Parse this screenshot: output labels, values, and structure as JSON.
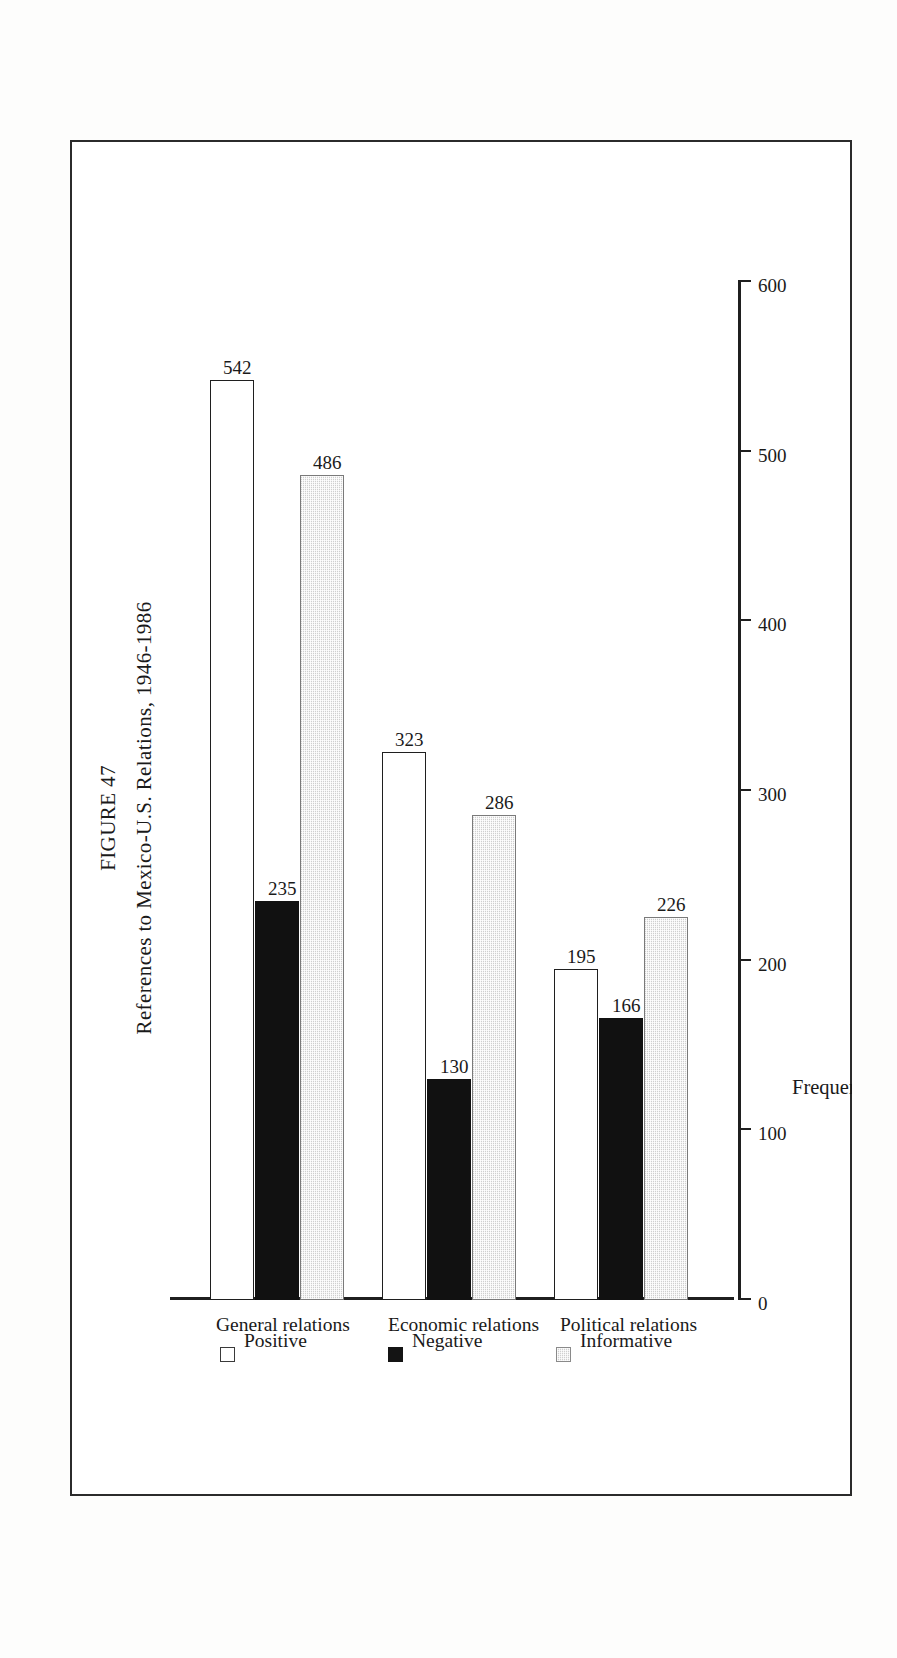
{
  "figure": {
    "number_label": "FIGURE 47",
    "caption": "References to Mexico-U.S. Relations, 1946-1986"
  },
  "legend": {
    "position": "below-plot",
    "entries": [
      {
        "label": "Positive",
        "swatch": "white-square-icon",
        "color": "#ffffff"
      },
      {
        "label": "Negative",
        "swatch": "black-square-icon",
        "color": "#111111"
      },
      {
        "label": "Informative",
        "swatch": "gray-hatched-square-icon",
        "color": "#cfcfcf"
      }
    ]
  },
  "axes": {
    "value_axis_title": "Frequency",
    "value_ticks": [
      "0",
      "100",
      "200",
      "300",
      "400",
      "500",
      "600"
    ],
    "category_labels": [
      "General relations",
      "Economic relations",
      "Political relations"
    ]
  },
  "chart_data": {
    "type": "bar",
    "orientation": "horizontal",
    "title": "References to Mexico-U.S. Relations, 1946-1986",
    "subtitle": "FIGURE 47",
    "categories": [
      "General relations",
      "Economic relations",
      "Political relations"
    ],
    "series": [
      {
        "name": "Positive",
        "values": [
          542,
          323,
          195
        ],
        "color": "#ffffff"
      },
      {
        "name": "Negative",
        "values": [
          235,
          130,
          166
        ],
        "color": "#111111"
      },
      {
        "name": "Informative",
        "values": [
          486,
          286,
          226
        ],
        "color": "#cfcfcf"
      }
    ],
    "xlabel": "Frequency",
    "ylabel": "",
    "xlim": [
      0,
      600
    ],
    "xticks": [
      0,
      100,
      200,
      300,
      400,
      500,
      600
    ],
    "grid": false,
    "data_labels": true,
    "legend": [
      "Positive",
      "Negative",
      "Informative"
    ],
    "legend_position": "below",
    "page_rotation_degrees": 90
  }
}
